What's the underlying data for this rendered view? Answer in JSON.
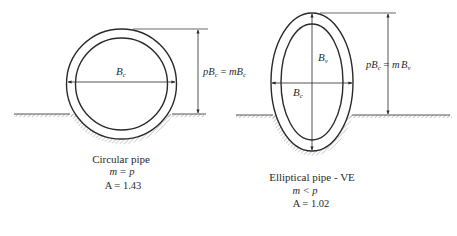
{
  "figure": {
    "left": {
      "shape": "circular",
      "width_label": "B",
      "width_sub": "c",
      "height_label_p": "p",
      "height_label_B": "B",
      "height_label_sub": "c",
      "height_label_eq": " = ",
      "height_label_m": "m",
      "height_label_B2": "B",
      "height_label_sub2": "c",
      "caption_title": "Circular pipe",
      "caption_relation": "m = p",
      "caption_area": "A = 1.43"
    },
    "right": {
      "shape": "elliptical",
      "vertical_label": "B",
      "vertical_sub": "v",
      "width_label": "B",
      "width_sub": "c",
      "height_label_p": "p",
      "height_label_B": "B",
      "height_label_sub": "c",
      "height_label_eq": " = ",
      "height_label_m": "m",
      "height_label_B2": "B",
      "height_label_sub2": "v",
      "caption_title": "Elliptical pipe - VE",
      "caption_relation": "m < p",
      "caption_area": "A = 1.02"
    }
  },
  "colors": {
    "ink": "#2a2a2a",
    "hatch": "#8a8a8a",
    "background": "#ffffff"
  }
}
